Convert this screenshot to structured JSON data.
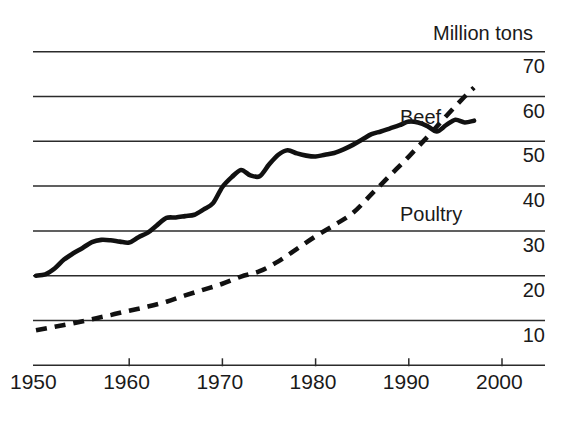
{
  "chart_data": {
    "type": "line",
    "title": "",
    "subtitle": "",
    "unit_label": "Million tons",
    "xlabel": "",
    "ylabel": "Million tons",
    "xlim": [
      1950,
      2000
    ],
    "ylim": [
      0,
      75
    ],
    "grid": true,
    "grid_lines_y": [
      10,
      20,
      30,
      40,
      50,
      60,
      70
    ],
    "legend_position": "inline-annotation",
    "x_tick_labels": [
      "1950",
      "1960",
      "1970",
      "1980",
      "1990",
      "2000"
    ],
    "x_ticks": [
      1950,
      1960,
      1970,
      1980,
      1990,
      2000
    ],
    "y_tick_labels": [
      "70",
      "60",
      "50",
      "40",
      "30",
      "20",
      "10"
    ],
    "y_ticks": [
      70,
      60,
      50,
      40,
      30,
      20,
      10
    ],
    "series": [
      {
        "name": "Beef",
        "style": "solid",
        "color": "#111111",
        "x": [
          1950,
          1951,
          1952,
          1953,
          1954,
          1955,
          1956,
          1957,
          1958,
          1959,
          1960,
          1961,
          1962,
          1963,
          1964,
          1965,
          1966,
          1967,
          1968,
          1969,
          1970,
          1971,
          1972,
          1973,
          1974,
          1975,
          1976,
          1977,
          1978,
          1979,
          1980,
          1981,
          1982,
          1983,
          1984,
          1985,
          1986,
          1987,
          1988,
          1989,
          1990,
          1991,
          1992,
          1993,
          1994,
          1995,
          1996,
          1997
        ],
        "values": [
          20.0,
          20.3,
          21.6,
          23.6,
          25.0,
          26.2,
          27.5,
          28.0,
          27.9,
          27.6,
          27.4,
          28.6,
          29.6,
          31.3,
          32.9,
          33.0,
          33.3,
          33.6,
          34.8,
          36.2,
          39.8,
          42.0,
          43.6,
          42.4,
          42.2,
          44.8,
          47.0,
          48.0,
          47.3,
          46.8,
          46.6,
          47.0,
          47.4,
          48.2,
          49.2,
          50.4,
          51.6,
          52.2,
          52.9,
          53.6,
          54.4,
          54.2,
          53.4,
          52.2,
          53.6,
          54.8,
          54.2,
          54.6
        ]
      },
      {
        "name": "Poultry",
        "style": "dashed",
        "color": "#111111",
        "x": [
          1950,
          1952,
          1954,
          1956,
          1958,
          1960,
          1962,
          1964,
          1966,
          1968,
          1970,
          1972,
          1974,
          1976,
          1978,
          1980,
          1982,
          1984,
          1986,
          1988,
          1990,
          1992,
          1994,
          1996,
          1997
        ],
        "values": [
          7.8,
          8.6,
          9.4,
          10.3,
          11.2,
          12.2,
          13.1,
          14.2,
          15.6,
          16.9,
          18.2,
          19.8,
          21.0,
          23.2,
          26.0,
          28.8,
          31.3,
          34.0,
          38.2,
          42.4,
          46.6,
          51.0,
          55.6,
          60.0,
          62.0
        ]
      }
    ]
  },
  "annotations": {
    "beef_label": "Beef",
    "poultry_label": "Poultry",
    "unit_label": "Million tons"
  },
  "axis": {
    "x_labels": [
      {
        "text": "1950"
      },
      {
        "text": "1960"
      },
      {
        "text": "1970"
      },
      {
        "text": "1980"
      },
      {
        "text": "1990"
      },
      {
        "text": "2000"
      }
    ],
    "y_labels": [
      {
        "text": "70"
      },
      {
        "text": "60"
      },
      {
        "text": "50"
      },
      {
        "text": "40"
      },
      {
        "text": "30"
      },
      {
        "text": "20"
      },
      {
        "text": "10"
      }
    ]
  }
}
